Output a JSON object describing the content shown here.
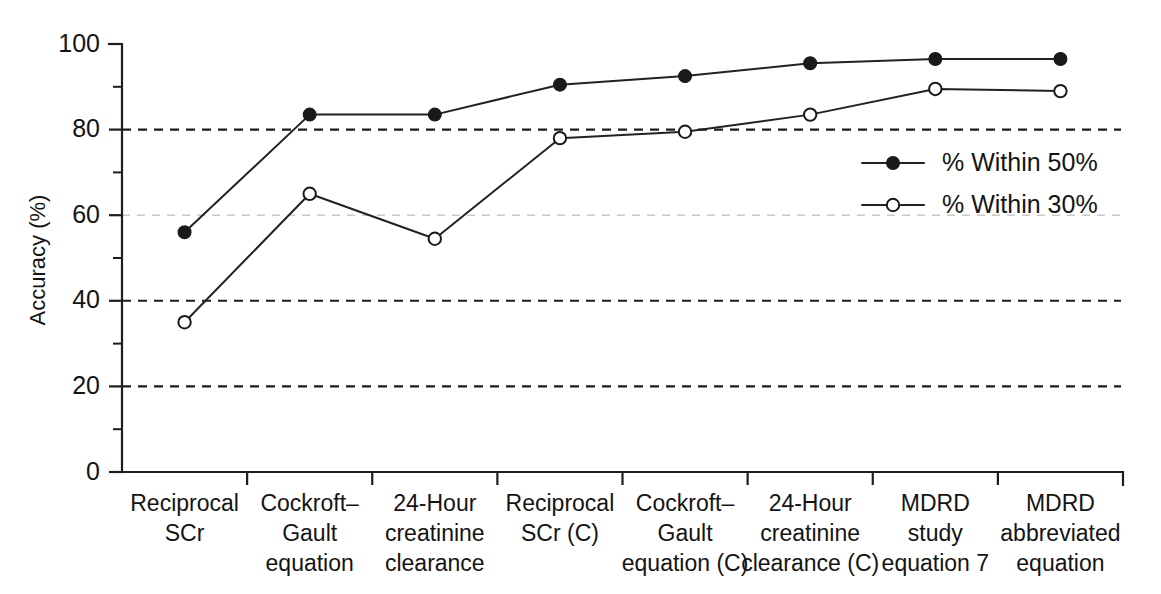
{
  "chart_data": {
    "type": "line",
    "title": "",
    "xlabel": "",
    "ylabel": "Accuracy (%)",
    "ylim": [
      0,
      100
    ],
    "yticks": [
      0,
      20,
      40,
      60,
      80,
      100
    ],
    "ytick_labels": [
      "0",
      "20",
      "40",
      "60",
      "80",
      "100"
    ],
    "yminor_ticks": [
      10,
      30,
      50,
      70,
      90
    ],
    "grid": "horizontal dashed gridlines at 20, 40, 60 (faint), 80",
    "gridlines": [
      20,
      40,
      60,
      80
    ],
    "legend_position": "right-middle",
    "categories": [
      "Reciprocal\nSCr",
      "Cockroft–\nGault\nequation",
      "24-Hour\ncreatinine\nclearance",
      "Reciprocal\nSCr (C)",
      "Cockroft–\nGault\nequation (C)",
      "24-Hour\ncreatinine\nclearance (C)",
      "MDRD\nstudy\nequation 7",
      "MDRD\nabbreviated\nequation"
    ],
    "series": [
      {
        "name": "% Within 50%",
        "marker": "filled-circle",
        "color": "#1a1a1a",
        "values": [
          56,
          83.5,
          83.5,
          90.5,
          92.5,
          95.5,
          96.5,
          96.5
        ]
      },
      {
        "name": "% Within 30%",
        "marker": "open-circle",
        "color": "#1a1a1a",
        "values": [
          35,
          65,
          54.5,
          78,
          79.5,
          83.5,
          89.5,
          89
        ]
      }
    ]
  },
  "legend": {
    "entries": [
      {
        "label": "% Within 50%",
        "marker": "filled-circle"
      },
      {
        "label": "% Within 30%",
        "marker": "open-circle"
      }
    ]
  },
  "axes": {
    "y_title": "Accuracy (%)"
  }
}
